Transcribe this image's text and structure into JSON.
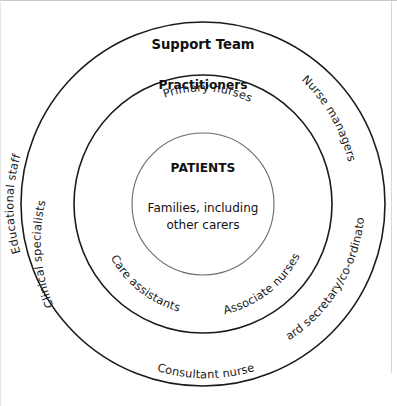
{
  "diagram": {
    "type": "concentric-rings",
    "center": {
      "x": 202,
      "y": 203
    },
    "rings": [
      {
        "name": "outer-ring",
        "label": "Support Team",
        "radius": 182
      },
      {
        "name": "middle-ring",
        "label": "Practitioners",
        "radius": 129
      },
      {
        "name": "inner-ring",
        "label": "PATIENTS",
        "radius": 71
      }
    ],
    "core": {
      "heading": "PATIENTS",
      "subtext_line1": "Families, including",
      "subtext_line2": "other carers"
    },
    "middle_ring": {
      "heading": "Practitioners",
      "members": [
        "Primary nurses",
        "Associate nurses",
        "Consultant nurse",
        "Care assistants"
      ]
    },
    "outer_ring": {
      "heading": "Support Team",
      "members": [
        "Nurse managers",
        "Ward secretary/co-ordinator",
        "Clinical specialists",
        "Educational staff"
      ]
    },
    "colors": {
      "stroke_outer": "#1b1b1b",
      "stroke_inner": "#6a6a6a",
      "text": "#111111",
      "background": "#ffffff",
      "frame_rule": "#c9c9c9"
    }
  }
}
